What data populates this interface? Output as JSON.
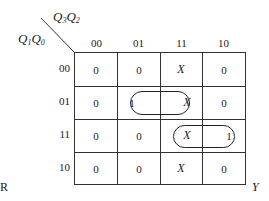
{
  "kmap": {
    "col_var": {
      "a": "Q",
      "a_sub": "3",
      "b": "Q",
      "b_sub": "2"
    },
    "row_var": {
      "a": "Q",
      "a_sub": "1",
      "b": "Q",
      "b_sub": "0"
    },
    "col_labels": [
      "00",
      "01",
      "11",
      "10"
    ],
    "row_labels": [
      "00",
      "01",
      "11",
      "10"
    ],
    "cells": [
      [
        "0",
        "0",
        "X",
        "0"
      ],
      [
        "0",
        "1",
        "X",
        "0"
      ],
      [
        "0",
        "0",
        "X",
        "1"
      ],
      [
        "0",
        "0",
        "X",
        "0"
      ]
    ],
    "groupings": [
      {
        "row": "01",
        "cols": [
          "01",
          "11"
        ]
      },
      {
        "row": "11",
        "cols": [
          "11",
          "10"
        ]
      }
    ],
    "output_label": "Y",
    "left_label": "R"
  }
}
